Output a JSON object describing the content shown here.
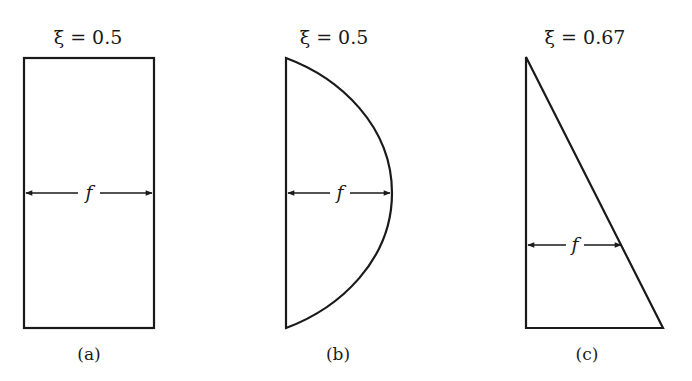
{
  "figure": {
    "panels": [
      {
        "id": "a",
        "shape": "rectangle",
        "xi_label": "ξ = 0.5",
        "dimension_label": "f",
        "caption": "(a)"
      },
      {
        "id": "b",
        "shape": "semi-ellipse",
        "xi_label": "ξ = 0.5",
        "dimension_label": "f",
        "caption": "(b)"
      },
      {
        "id": "c",
        "shape": "right-triangle",
        "xi_label": "ξ = 0.67",
        "dimension_label": "f",
        "caption": "(c)"
      }
    ]
  },
  "colors": {
    "line": "#1a1a1a",
    "background": "#ffffff"
  }
}
